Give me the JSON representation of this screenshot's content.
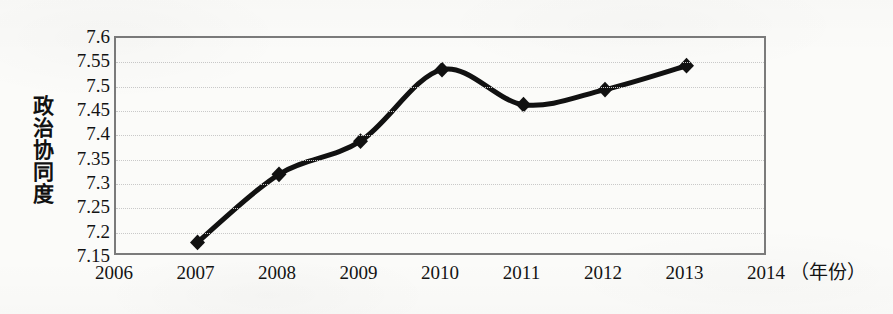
{
  "chart_data": {
    "type": "line",
    "title": "",
    "subtitle": "",
    "xlabel": "年份",
    "xlabel_display": "（年份）",
    "ylabel": "政治协同度",
    "x": [
      2007,
      2008,
      2009,
      2010,
      2011,
      2012,
      2013
    ],
    "values": [
      7.18,
      7.32,
      7.388,
      7.535,
      7.463,
      7.494,
      7.543
    ],
    "series": [
      {
        "name": "政治协同度",
        "values": [
          7.18,
          7.32,
          7.388,
          7.535,
          7.463,
          7.494,
          7.543
        ]
      }
    ],
    "categories": [
      "2007",
      "2008",
      "2009",
      "2010",
      "2011",
      "2012",
      "2013"
    ],
    "xlim": [
      2006,
      2014
    ],
    "ylim": [
      7.15,
      7.6
    ],
    "x_ticks": [
      "2006",
      "2007",
      "2008",
      "2009",
      "2010",
      "2011",
      "2012",
      "2013",
      "2014"
    ],
    "y_ticks": [
      "7.15",
      "7.2",
      "7.25",
      "7.3",
      "7.35",
      "7.4",
      "7.45",
      "7.5",
      "7.55",
      "7.6"
    ],
    "y_tick_step": 0.05,
    "grid": "horizontal-dotted",
    "legend": "none",
    "marker": "diamond",
    "line_color": "#111111",
    "line_width": 5,
    "marker_color": "#111111",
    "frame_color": "#7b7b7b",
    "gridline_color": "#c9c9c9",
    "background_color": "#fbfbf9",
    "smoothing": "spline"
  }
}
